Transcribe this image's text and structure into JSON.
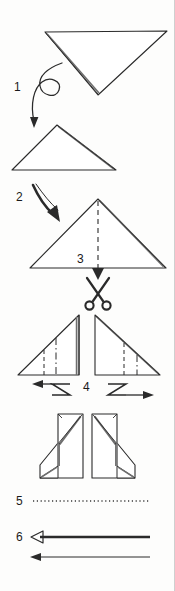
{
  "document": {
    "type": "origami-instruction-diagram",
    "title": "Origami folding and cutting instructions",
    "background_color": "#fdfdfc",
    "ink_color": "#1a1a1a",
    "border_color": "#cfcfcf",
    "width": 175,
    "height": 591
  },
  "steps": [
    {
      "number": "1",
      "label": "1",
      "instruction_icon": "loop-flip-arrow-icon",
      "description": "Flip the downward-pointing triangle over"
    },
    {
      "number": "2",
      "label": "2",
      "instruction_icon": "curved-arrow-icon",
      "description": "Fold down to form the upward triangle"
    },
    {
      "number": "3",
      "label": "3",
      "instruction_icon": "scissors-icon",
      "description": "Cut along the dashed centre line"
    },
    {
      "number": "4",
      "label": "4",
      "instruction_icon": "z-fold-arrow-icon",
      "description": "Z-fold each half outward"
    },
    {
      "number": "5",
      "label": "5",
      "instruction_icon": "dotted-line-icon",
      "description": "Dotted reference line"
    },
    {
      "number": "6",
      "label": "6",
      "instruction_icon": "double-left-arrow-icon",
      "description": "Pull both layers to the left"
    }
  ],
  "figures": [
    {
      "name": "triangle-down",
      "step": "1",
      "description": "Large downward-pointing triangle with doubled right edge"
    },
    {
      "name": "triangle-up-small",
      "step": "1",
      "description": "Resulting upward-pointing triangle"
    },
    {
      "name": "triangle-up-cut",
      "step": "3",
      "description": "Upward triangle with vertical dashed cut line from apex to base"
    },
    {
      "name": "half-triangle-left",
      "step": "4",
      "description": "Left half right-triangle with dashed and dash-dot fold lines"
    },
    {
      "name": "half-triangle-right",
      "step": "4",
      "description": "Right half right-triangle, mirrored, with fold lines"
    },
    {
      "name": "folded-shape-left",
      "step": "5",
      "description": "Left folded form with angled top and bottom flap"
    },
    {
      "name": "folded-shape-right",
      "step": "5",
      "description": "Right folded form, mirrored"
    }
  ]
}
